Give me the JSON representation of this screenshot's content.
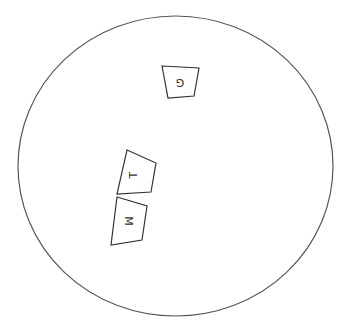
{
  "diagram": {
    "background": "#ffffff",
    "stroke_color": "#555555",
    "circle": {
      "cx": 175.5,
      "cy": 166,
      "rx": 157.5,
      "ry": 150
    },
    "shapes": [
      {
        "id": "G",
        "label": "G",
        "points": "162,66 199,68 194,96 168,98",
        "label_x": 173,
        "label_y": 74,
        "rotation": 180
      },
      {
        "id": "T",
        "label": "T",
        "points": "127,150 156,163 151,192 117,194",
        "label_x": 128,
        "label_y": 168,
        "rotation": -90
      },
      {
        "id": "M",
        "label": "M",
        "points": "117,197 147,206 142,240 111,245",
        "label_x": 120,
        "label_y": 214,
        "rotation": 90
      }
    ]
  }
}
